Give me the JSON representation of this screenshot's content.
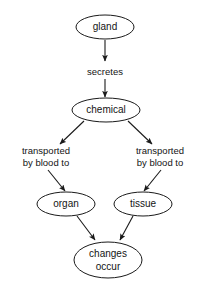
{
  "diagram": {
    "type": "flowchart",
    "background_color": "#ffffff",
    "stroke_color": "#1a1a1a",
    "text_color": "#141414",
    "nodes": [
      {
        "id": "gland",
        "label": "gland",
        "shape": "ellipse",
        "cx": 105,
        "cy": 27,
        "rx": 29,
        "ry": 12
      },
      {
        "id": "chemical",
        "label": "chemical",
        "shape": "ellipse",
        "cx": 106,
        "cy": 110,
        "rx": 34,
        "ry": 12
      },
      {
        "id": "organ",
        "label": "organ",
        "shape": "ellipse",
        "cx": 66,
        "cy": 204,
        "rx": 29,
        "ry": 12
      },
      {
        "id": "tissue",
        "label": "tissue",
        "shape": "ellipse",
        "cx": 143,
        "cy": 204,
        "rx": 29,
        "ry": 12
      },
      {
        "id": "changes",
        "label_line1": "changes",
        "label_line2": "occur",
        "shape": "ellipse",
        "cx": 108,
        "cy": 260,
        "rx": 34,
        "ry": 18
      }
    ],
    "edge_labels": [
      {
        "id": "secretes",
        "text": "secretes",
        "x": 105,
        "y": 72
      },
      {
        "id": "transported-left",
        "line1": "transported",
        "line2": "by blood to",
        "x": 46,
        "y": 156
      },
      {
        "id": "transported-right",
        "line1": "transported",
        "line2": "by blood to",
        "x": 160,
        "y": 156
      }
    ],
    "edges": [
      {
        "id": "gland-to-secretes",
        "from": "gland",
        "to": "secretes",
        "x1": 105,
        "y1": 40,
        "x2": 105,
        "y2": 61
      },
      {
        "id": "secretes-to-chemical",
        "from": "secretes",
        "to": "chemical",
        "x1": 105,
        "y1": 79,
        "x2": 105,
        "y2": 97
      },
      {
        "id": "chemical-to-left-label",
        "from": "chemical",
        "to": "transported-left",
        "x1": 84,
        "y1": 121,
        "x2": 60,
        "y2": 144
      },
      {
        "id": "chemical-to-right-label",
        "from": "chemical",
        "to": "transported-right",
        "x1": 128,
        "y1": 121,
        "x2": 152,
        "y2": 144
      },
      {
        "id": "left-label-to-organ",
        "from": "transported-left",
        "to": "organ",
        "x1": 48,
        "y1": 170,
        "x2": 66,
        "y2": 191
      },
      {
        "id": "right-label-to-tissue",
        "from": "transported-right",
        "to": "tissue",
        "x1": 161,
        "y1": 170,
        "x2": 143,
        "y2": 191
      },
      {
        "id": "organ-to-changes",
        "from": "organ",
        "to": "changes",
        "x1": 77,
        "y1": 216,
        "x2": 95,
        "y2": 240
      },
      {
        "id": "tissue-to-changes",
        "from": "tissue",
        "to": "changes",
        "x1": 133,
        "y1": 216,
        "x2": 120,
        "y2": 240
      }
    ]
  }
}
